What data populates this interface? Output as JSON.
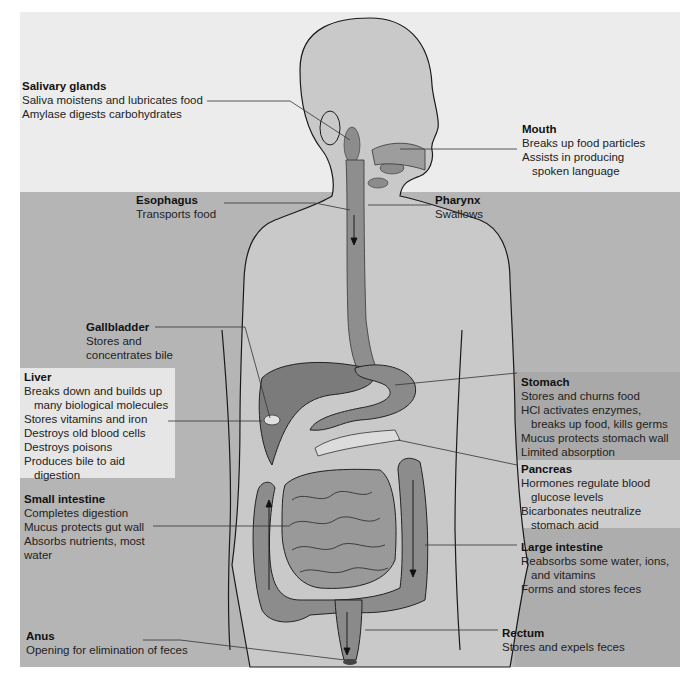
{
  "figure": {
    "colors": {
      "page_bg": "#ffffff",
      "top_band": "#ececec",
      "main_band": "#b7b7b7",
      "light_box": "#e4e4e4",
      "mid_box": "#c9c9c9",
      "body_fill": "#c8c8c8",
      "organ_fill": "#8a8a8a",
      "outline": "#1a1a1a",
      "leader": "#333333"
    }
  },
  "labels": {
    "salivary": {
      "title": "Salivary glands",
      "lines": [
        "Saliva moistens and lubricates food",
        "Amylase digests carbohydrates"
      ]
    },
    "mouth": {
      "title": "Mouth",
      "lines": [
        "Breaks up food particles",
        "Assists in producing",
        "spoken language"
      ]
    },
    "esophagus": {
      "title": "Esophagus",
      "lines": [
        "Transports food"
      ]
    },
    "pharynx": {
      "title": "Pharynx",
      "lines": [
        "Swallows"
      ]
    },
    "gallbladder": {
      "title": "Gallbladder",
      "lines": [
        "Stores and",
        "concentrates bile"
      ]
    },
    "liver": {
      "title": "Liver",
      "lines": [
        "Breaks down and builds up",
        "many biological molecules",
        "Stores vitamins and iron",
        "Destroys old blood cells",
        "Destroys poisons",
        "Produces bile to aid",
        "digestion"
      ]
    },
    "stomach": {
      "title": "Stomach",
      "lines": [
        "Stores and churns food",
        "HCl activates enzymes,",
        "breaks up food, kills germs",
        "Mucus protects stomach wall",
        "Limited absorption"
      ]
    },
    "pancreas": {
      "title": "Pancreas",
      "lines": [
        "Hormones regulate blood",
        "glucose levels",
        "Bicarbonates neutralize",
        "stomach acid"
      ]
    },
    "small_intestine": {
      "title": "Small intestine",
      "lines": [
        "Completes digestion",
        "Mucus protects gut wall",
        "Absorbs nutrients, most",
        "water"
      ]
    },
    "large_intestine": {
      "title": "Large intestine",
      "lines": [
        "Reabsorbs some water, ions,",
        "and vitamins",
        "Forms and stores feces"
      ]
    },
    "anus": {
      "title": "Anus",
      "lines": [
        "Opening for elimination of feces"
      ]
    },
    "rectum": {
      "title": "Rectum",
      "lines": [
        "Stores and expels feces"
      ]
    }
  }
}
